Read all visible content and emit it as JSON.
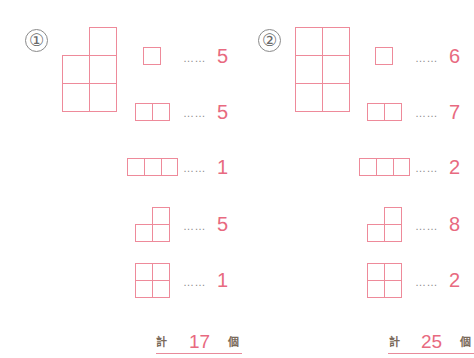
{
  "problems": [
    {
      "label": "①",
      "figure": "3x2 grid with bottom-left top cell missing (5 unit squares)",
      "rows": [
        {
          "shape": "1x1 square",
          "dots": "……",
          "count": "5"
        },
        {
          "shape": "1x2 domino",
          "dots": "……",
          "count": "5"
        },
        {
          "shape": "1x3 triomino",
          "dots": "……",
          "count": "1"
        },
        {
          "shape": "L-triomino",
          "dots": "……",
          "count": "5"
        },
        {
          "shape": "2x2 square",
          "dots": "……",
          "count": "1"
        }
      ],
      "total": {
        "prefix": "計",
        "value": "17",
        "suffix": "個"
      }
    },
    {
      "label": "②",
      "figure": "3x2 full grid (6 unit squares)",
      "rows": [
        {
          "shape": "1x1 square",
          "dots": "……",
          "count": "6"
        },
        {
          "shape": "1x2 domino",
          "dots": "……",
          "count": "7"
        },
        {
          "shape": "1x3 triomino",
          "dots": "……",
          "count": "2"
        },
        {
          "shape": "L-triomino",
          "dots": "……",
          "count": "8"
        },
        {
          "shape": "2x2 square",
          "dots": "……",
          "count": "2"
        }
      ],
      "total": {
        "prefix": "計",
        "value": "25",
        "suffix": "個"
      }
    }
  ],
  "colors": {
    "line": "#ee8a9a",
    "number": "#e86a80",
    "dots": "#8c8c8c"
  }
}
